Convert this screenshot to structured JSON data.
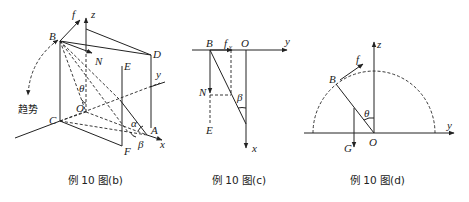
{
  "figures": [
    {
      "id": "b",
      "caption": "例 10 图(b)",
      "labels": {
        "f": "f",
        "z": "z",
        "B": "B",
        "N": "N",
        "E": "E",
        "D": "D",
        "y": "y",
        "theta": "θ",
        "O": "O",
        "trend": "趋势",
        "C": "C",
        "alpha": "α",
        "A": "A",
        "x": "x",
        "F": "F",
        "beta": "β"
      }
    },
    {
      "id": "c",
      "caption": "例 10 图(c)",
      "labels": {
        "B": "B",
        "fy": "f",
        "fy_sub": "y",
        "O": "O",
        "y": "y",
        "N": "N",
        "beta": "β",
        "E": "E",
        "x": "x"
      }
    },
    {
      "id": "d",
      "caption": "例 10 图(d)",
      "labels": {
        "z": "z",
        "f": "f",
        "B": "B",
        "theta": "θ",
        "y": "y",
        "G": "G",
        "O": "O"
      }
    }
  ]
}
